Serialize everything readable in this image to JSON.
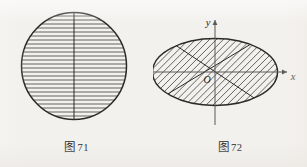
{
  "page": {
    "background_color": "#f3f1ee",
    "ink_color": "#2b2a28",
    "width": 307,
    "height": 167
  },
  "figures": [
    {
      "id": "figure-71",
      "caption_prefix": "图",
      "caption_number": "71",
      "shape": "circle",
      "shape_name": "hatched-circle",
      "hatch_direction": "horizontal",
      "hatch_count": 26,
      "has_vertical_diameter": true,
      "has_axes": false,
      "center_x": 74,
      "center_y": 66,
      "radius_x": 53,
      "radius_y": 54,
      "stroke_color": "#2b2a28",
      "hatch_color": "#4a4a48"
    },
    {
      "id": "figure-72",
      "caption_prefix": "图",
      "caption_number": "72",
      "shape": "ellipse",
      "shape_name": "hatched-ellipse",
      "hatch_direction": "diagonal",
      "hatch_count": 30,
      "has_axes": true,
      "axis_x_label": "x",
      "axis_y_label": "y",
      "origin_label": "O",
      "diagonal_chords": 2,
      "center_x": 62,
      "center_y": 72,
      "radius_x": 63,
      "radius_y": 34,
      "stroke_color": "#2b2a28",
      "hatch_color": "#4a4a48",
      "axis_color": "#5a5956"
    }
  ]
}
